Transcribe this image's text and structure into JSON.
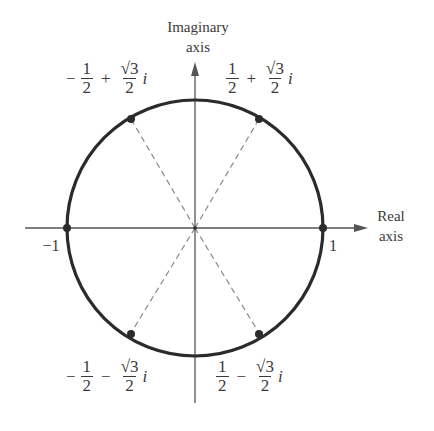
{
  "diagram": {
    "axes": {
      "imaginary_label_line1": "Imaginary",
      "imaginary_label_line2": "axis",
      "real_label_line1": "Real",
      "real_label_line2": "axis"
    },
    "tick_labels": {
      "neg_one": "−1",
      "pos_one": "1"
    },
    "points": [
      {
        "id": "p60",
        "sign": "",
        "num_re": "1",
        "den_re": "2",
        "op": "+",
        "sqrt_sym": "√",
        "rad": "3",
        "den_im": "2",
        "i": "i"
      },
      {
        "id": "p120",
        "sign": "−",
        "num_re": "1",
        "den_re": "2",
        "op": "+",
        "sqrt_sym": "√",
        "rad": "3",
        "den_im": "2",
        "i": "i"
      },
      {
        "id": "p240",
        "sign": "−",
        "num_re": "1",
        "den_re": "2",
        "op": "−",
        "sqrt_sym": "√",
        "rad": "3",
        "den_im": "2",
        "i": "i"
      },
      {
        "id": "p300",
        "sign": "",
        "num_re": "1",
        "den_re": "2",
        "op": "−",
        "sqrt_sym": "√",
        "rad": "3",
        "den_im": "2",
        "i": "i"
      }
    ],
    "colors": {
      "circle": "#2b2b2b",
      "axis": "#555555",
      "dashed": "#8a8a8a",
      "text": "#3a3a3a"
    }
  }
}
